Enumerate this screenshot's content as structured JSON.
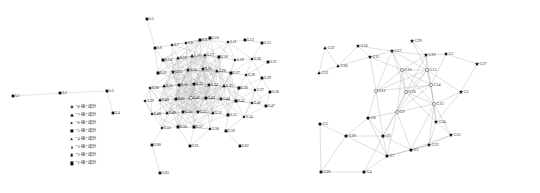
{
  "figure": {
    "background": "#ffffff",
    "edge_color": "#9a9a9a",
    "node_color": "#111111",
    "text_color": "#1a1a1a"
  },
  "chart_data": {
    "type": "scatter",
    "title": "",
    "subtitle": "",
    "xlabel": "",
    "ylabel": "",
    "panels": [
      {
        "name": "left-network",
        "label": "",
        "node_count": 63,
        "legend_position": "lower-left",
        "nodes": [
          {
            "id": "L1",
            "x": 13,
            "y": 96,
            "shell": 1
          },
          {
            "id": "L2",
            "x": 60,
            "y": 93,
            "shell": 1
          },
          {
            "id": "L3",
            "x": 107,
            "y": 91,
            "shell": 1
          },
          {
            "id": "L4",
            "x": 113,
            "y": 113,
            "shell": 1
          },
          {
            "id": "L5",
            "x": 147,
            "y": 19,
            "shell": 1
          },
          {
            "id": "L6",
            "x": 155,
            "y": 48,
            "shell": 2
          },
          {
            "id": "L7",
            "x": 172,
            "y": 45,
            "shell": 3
          },
          {
            "id": "L8",
            "x": 186,
            "y": 43,
            "shell": 3
          },
          {
            "id": "L9",
            "x": 200,
            "y": 40,
            "shell": 4
          },
          {
            "id": "L10",
            "x": 210,
            "y": 38,
            "shell": 4
          },
          {
            "id": "L11",
            "x": 228,
            "y": 42,
            "shell": 3
          },
          {
            "id": "L12",
            "x": 245,
            "y": 40,
            "shell": 2
          },
          {
            "id": "L13",
            "x": 262,
            "y": 43,
            "shell": 2
          },
          {
            "id": "L14",
            "x": 163,
            "y": 60,
            "shell": 4
          },
          {
            "id": "L15",
            "x": 178,
            "y": 58,
            "shell": 5
          },
          {
            "id": "L16",
            "x": 192,
            "y": 56,
            "shell": 5
          },
          {
            "id": "L17",
            "x": 205,
            "y": 55,
            "shell": 5
          },
          {
            "id": "L18",
            "x": 219,
            "y": 57,
            "shell": 4
          },
          {
            "id": "L19",
            "x": 235,
            "y": 60,
            "shell": 3
          },
          {
            "id": "L20",
            "x": 252,
            "y": 59,
            "shell": 3
          },
          {
            "id": "L21",
            "x": 268,
            "y": 62,
            "shell": 2
          },
          {
            "id": "L22",
            "x": 158,
            "y": 73,
            "shell": 4
          },
          {
            "id": "L23",
            "x": 173,
            "y": 72,
            "shell": 6
          },
          {
            "id": "L24",
            "x": 188,
            "y": 70,
            "shell": 6
          },
          {
            "id": "L25",
            "x": 203,
            "y": 69,
            "shell": 6
          },
          {
            "id": "L26",
            "x": 217,
            "y": 71,
            "shell": 5
          },
          {
            "id": "L27",
            "x": 231,
            "y": 73,
            "shell": 4
          },
          {
            "id": "L28",
            "x": 246,
            "y": 75,
            "shell": 3
          },
          {
            "id": "L29",
            "x": 262,
            "y": 78,
            "shell": 2
          },
          {
            "id": "L30",
            "x": 150,
            "y": 88,
            "shell": 3
          },
          {
            "id": "L31",
            "x": 164,
            "y": 86,
            "shell": 5
          },
          {
            "id": "L32",
            "x": 179,
            "y": 85,
            "shell": 7
          },
          {
            "id": "L33",
            "x": 194,
            "y": 84,
            "shell": 7
          },
          {
            "id": "L34",
            "x": 209,
            "y": 85,
            "shell": 6
          },
          {
            "id": "L35",
            "x": 224,
            "y": 86,
            "shell": 5
          },
          {
            "id": "L36",
            "x": 239,
            "y": 88,
            "shell": 4
          },
          {
            "id": "L37",
            "x": 255,
            "y": 90,
            "shell": 3
          },
          {
            "id": "L38",
            "x": 270,
            "y": 92,
            "shell": 2
          },
          {
            "id": "L39",
            "x": 145,
            "y": 101,
            "shell": 3
          },
          {
            "id": "L40",
            "x": 160,
            "y": 100,
            "shell": 5
          },
          {
            "id": "L41",
            "x": 176,
            "y": 99,
            "shell": 7
          },
          {
            "id": "L42",
            "x": 191,
            "y": 98,
            "shell": 8
          },
          {
            "id": "L43",
            "x": 206,
            "y": 98,
            "shell": 7
          },
          {
            "id": "L44",
            "x": 221,
            "y": 99,
            "shell": 6
          },
          {
            "id": "L45",
            "x": 236,
            "y": 101,
            "shell": 4
          },
          {
            "id": "L46",
            "x": 252,
            "y": 103,
            "shell": 3
          },
          {
            "id": "L47",
            "x": 266,
            "y": 106,
            "shell": 2
          },
          {
            "id": "L48",
            "x": 152,
            "y": 114,
            "shell": 3
          },
          {
            "id": "L49",
            "x": 167,
            "y": 113,
            "shell": 5
          },
          {
            "id": "L50",
            "x": 183,
            "y": 112,
            "shell": 6
          },
          {
            "id": "L51",
            "x": 198,
            "y": 112,
            "shell": 6
          },
          {
            "id": "L52",
            "x": 213,
            "y": 113,
            "shell": 5
          },
          {
            "id": "L53",
            "x": 228,
            "y": 115,
            "shell": 4
          },
          {
            "id": "L54",
            "x": 244,
            "y": 117,
            "shell": 3
          },
          {
            "id": "L55",
            "x": 162,
            "y": 128,
            "shell": 3
          },
          {
            "id": "L56",
            "x": 178,
            "y": 127,
            "shell": 4
          },
          {
            "id": "L57",
            "x": 194,
            "y": 127,
            "shell": 4
          },
          {
            "id": "L58",
            "x": 210,
            "y": 129,
            "shell": 3
          },
          {
            "id": "L59",
            "x": 226,
            "y": 131,
            "shell": 2
          },
          {
            "id": "L60",
            "x": 152,
            "y": 145,
            "shell": 1
          },
          {
            "id": "L61",
            "x": 190,
            "y": 146,
            "shell": 2
          },
          {
            "id": "L62",
            "x": 240,
            "y": 146,
            "shell": 2
          },
          {
            "id": "L63",
            "x": 160,
            "y": 173,
            "shell": 1
          }
        ]
      },
      {
        "name": "right-network",
        "label": "",
        "node_count": 29,
        "legend_position": "right",
        "nodes": [
          {
            "id": "G22",
            "x": 37,
            "y": 48,
            "shell": 3
          },
          {
            "id": "G21",
            "x": 31,
            "y": 73,
            "shell": 3
          },
          {
            "id": "G20",
            "x": 50,
            "y": 66,
            "shell": 3
          },
          {
            "id": "G18",
            "x": 70,
            "y": 46,
            "shell": 4
          },
          {
            "id": "G11",
            "x": 82,
            "y": 57,
            "shell": 4
          },
          {
            "id": "G17",
            "x": 104,
            "y": 51,
            "shell": 4
          },
          {
            "id": "G29",
            "x": 124,
            "y": 41,
            "shell": 4
          },
          {
            "id": "G19",
            "x": 138,
            "y": 55,
            "shell": 4
          },
          {
            "id": "G1",
            "x": 158,
            "y": 54,
            "shell": 4
          },
          {
            "id": "G27",
            "x": 189,
            "y": 64,
            "shell": 4
          },
          {
            "id": "G2",
            "x": 173,
            "y": 92,
            "shell": 4
          },
          {
            "id": "G16",
            "x": 114,
            "y": 70,
            "shell": 6
          },
          {
            "id": "G15",
            "x": 139,
            "y": 70,
            "shell": 6
          },
          {
            "id": "G14",
            "x": 143,
            "y": 85,
            "shell": 6
          },
          {
            "id": "G12",
            "x": 88,
            "y": 91,
            "shell": 6
          },
          {
            "id": "G10",
            "x": 118,
            "y": 92,
            "shell": 6
          },
          {
            "id": "G13",
            "x": 146,
            "y": 104,
            "shell": 6
          },
          {
            "id": "G9",
            "x": 109,
            "y": 112,
            "shell": 6
          },
          {
            "id": "G8",
            "x": 80,
            "y": 118,
            "shell": 5
          },
          {
            "id": "G3",
            "x": 32,
            "y": 124,
            "shell": 5
          },
          {
            "id": "G28",
            "x": 58,
            "y": 136,
            "shell": 5
          },
          {
            "id": "G6",
            "x": 95,
            "y": 136,
            "shell": 5
          },
          {
            "id": "G5",
            "x": 123,
            "y": 150,
            "shell": 5
          },
          {
            "id": "G7",
            "x": 99,
            "y": 156,
            "shell": 5
          },
          {
            "id": "G4",
            "x": 76,
            "y": 172,
            "shell": 5
          },
          {
            "id": "G26",
            "x": 33,
            "y": 172,
            "shell": 7
          },
          {
            "id": "G24",
            "x": 148,
            "y": 122,
            "shell": 4
          },
          {
            "id": "G25",
            "x": 163,
            "y": 135,
            "shell": 4
          },
          {
            "id": "G23",
            "x": 141,
            "y": 145,
            "shell": 4
          }
        ]
      }
    ]
  },
  "left_panel": {
    "name": "left-network-panel",
    "legend": {
      "title": "",
      "items": [
        {
          "marker": "circle-open",
          "label": "“8-核” 成分",
          "shell": 8
        },
        {
          "marker": "pentagon",
          "label": "“7-核” 成分",
          "shell": 7
        },
        {
          "marker": "star",
          "label": "“6-核” 成分",
          "shell": 6
        },
        {
          "marker": "square",
          "label": "“5-核” 成分",
          "shell": 5
        },
        {
          "marker": "star-small",
          "label": "“4-核” 成分",
          "shell": 4
        },
        {
          "marker": "triangle-up",
          "label": "“3-核” 成分",
          "shell": 3
        },
        {
          "marker": "diamond",
          "label": "“2-核” 成分",
          "shell": 2
        },
        {
          "marker": "square-fill",
          "label": "“1-核” 成分",
          "shell": 1
        }
      ]
    }
  },
  "right_panel": {
    "name": "right-network-panel",
    "legend": {
      "title": "",
      "items": [
        {
          "marker": "circle-open",
          "label": "“6-核” 成分",
          "shell": 6
        },
        {
          "marker": "pentagon",
          "label": "“5-核” 成分",
          "shell": 5
        },
        {
          "marker": "star",
          "label": "“4-核” 成分",
          "shell": 4
        },
        {
          "marker": "triangle-up",
          "label": "“3-核” 成分",
          "shell": 3
        },
        {
          "marker": "diamond",
          "label": "“2-核” 成分",
          "shell": 2
        },
        {
          "marker": "square-fill",
          "label": "“1-核” 成分",
          "shell": 1
        },
        {
          "marker": "triangle-down",
          "label": "“0-核” 成分",
          "shell": 0
        }
      ]
    }
  }
}
